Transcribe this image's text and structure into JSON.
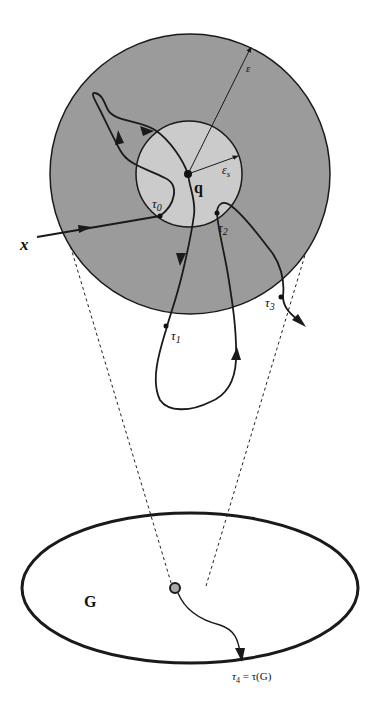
{
  "colors": {
    "outer_disk": "#9b9b9b",
    "inner_disk": "#cbcbcb",
    "stroke": "#1a1a1a",
    "background": "#ffffff",
    "start_point_fill": "#a8a8a8"
  },
  "labels": {
    "epsilon": "ε",
    "epsilon_s": "ε",
    "epsilon_s_sub": "s",
    "q": "q",
    "x": "x",
    "tau0": "τ",
    "tau0_sub": "0",
    "tau1": "τ",
    "tau1_sub": "1",
    "tau2": "τ",
    "tau2_sub": "2",
    "tau3": "τ",
    "tau3_sub": "3",
    "tau4": "τ",
    "tau4_sub": "4",
    "tau4_eq": " = τ(G)",
    "G": "G"
  },
  "figure": {
    "outer_circle": {
      "cx": 190,
      "cy": 174,
      "r": 140,
      "meaning": "ε-neighborhood of q"
    },
    "inner_circle": {
      "cx": 189,
      "cy": 174,
      "r": 53,
      "meaning": "ε_s-neighborhood of q"
    },
    "domain_G": {
      "cx": 190,
      "cy": 588,
      "rx": 168,
      "ry": 75
    },
    "point_q": {
      "x": 188,
      "y": 174
    },
    "projection_point": {
      "x": 175,
      "y": 588
    }
  }
}
